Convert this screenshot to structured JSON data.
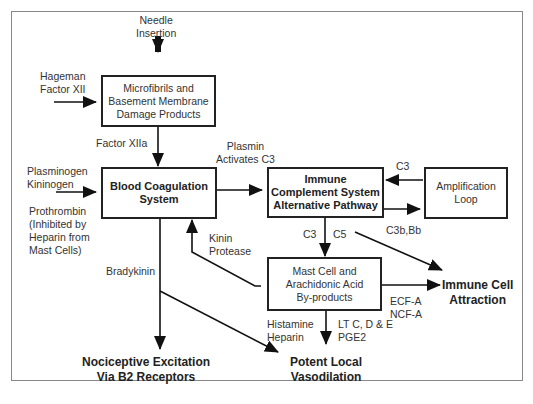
{
  "diagram": {
    "nodes": {
      "microfibrils": "Microfibrils and\nBasement Membrane\nDamage Products",
      "coagulation": "Blood Coagulation\nSystem",
      "complement": "Immune\nComplement System\nAlternative Pathway",
      "amplification": "Amplification\nLoop",
      "mast_cell": "Mast Cell and\nArachidonic Acid\nBy-products"
    },
    "inputs": {
      "needle": "Needle\nInsertion",
      "hageman": "Hageman\nFactor XII",
      "plasminogen": "Plasminogen\nKininogen",
      "prothrombin": "Prothrombin\n(Inhibited by\nHeparin from\nMast Cells)"
    },
    "edge_labels": {
      "factor_xiia": "Factor XIIa",
      "plasmin": "Plasmin\nActivates C3",
      "c3_top": "C3",
      "c3b_bb": "C3b,Bb",
      "c3_down": "C3",
      "c5": "C5",
      "kinin_protease": "Kinin\nProtease",
      "bradykinin": "Bradykinin",
      "ecf_ncf": "ECF-A\nNCF-A",
      "histamine": "Histamine\nHeparin",
      "lt": "LT C, D & E\nPGE2"
    },
    "outputs": {
      "nociceptive": "Nociceptive Excitation\nVia B2 Receptors",
      "vasodilation": "Potent Local\nVasodilation",
      "immune_attraction": "Immune Cell\nAttraction"
    }
  }
}
